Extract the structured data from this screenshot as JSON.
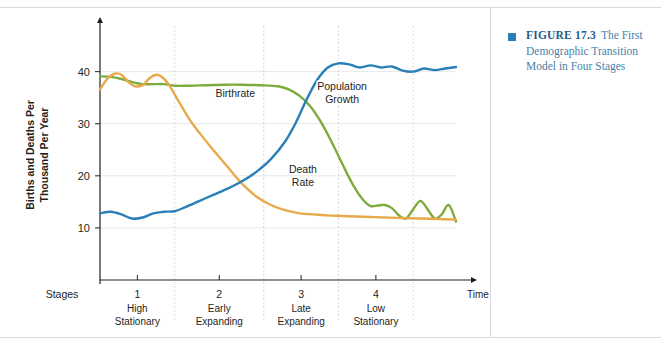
{
  "caption": {
    "figure_number": "FIGURE 17.3",
    "text": "The First Demographic Transition Model in Four Stages",
    "bullet_color": "#2b7fb8",
    "text_color": "#4a7fa8"
  },
  "chart_data": {
    "type": "line",
    "title": "",
    "xlabel": "Time",
    "ylabel": "Births and Deaths Per Thousand Per Year",
    "ylim": [
      0,
      48
    ],
    "xlim": [
      0,
      100
    ],
    "yticks": [
      10,
      20,
      30,
      40
    ],
    "ytick_labels": [
      "10",
      "20",
      "30",
      "40"
    ],
    "grid": true,
    "legend": "inline-annotations",
    "stages_axis_label": "Stages",
    "time_axis_label": "Time",
    "stage_boundaries": [
      21,
      46,
      67,
      88
    ],
    "stages": [
      {
        "number": "1",
        "name_line1": "High",
        "name_line2": "Stationary",
        "x": 10.5
      },
      {
        "number": "2",
        "name_line1": "Early",
        "name_line2": "Expanding",
        "x": 33.5
      },
      {
        "number": "3",
        "name_line1": "Late",
        "name_line2": "Expanding",
        "x": 56.5
      },
      {
        "number": "4",
        "name_line1": "Low",
        "name_line2": "Stationary",
        "x": 77.5
      }
    ],
    "series": [
      {
        "name": "Birthrate",
        "color": "#7dab3c",
        "label_x": 38,
        "label_y": 35.2,
        "label_lines": [
          "Birthrate"
        ],
        "x": [
          0,
          3,
          6,
          9,
          12,
          15,
          18,
          21,
          25,
          30,
          35,
          40,
          45,
          50,
          53,
          56,
          59,
          62,
          65,
          68,
          70,
          72,
          74,
          76,
          78,
          80,
          82,
          84,
          86,
          88,
          90,
          92,
          94,
          96,
          98,
          100
        ],
        "values": [
          39.1,
          39.0,
          38.6,
          38.0,
          37.6,
          37.6,
          37.6,
          37.3,
          37.3,
          37.4,
          37.5,
          37.5,
          37.4,
          37.2,
          36.6,
          35.4,
          33.4,
          30.4,
          26.6,
          22.4,
          19.6,
          17.2,
          15.3,
          14.2,
          14.3,
          14.4,
          13.8,
          12.4,
          11.8,
          13.6,
          15.2,
          13.6,
          11.8,
          12.6,
          14.4,
          11.2
        ]
      },
      {
        "name": "Death Rate",
        "color": "#e8a94a",
        "label_x": 57,
        "label_y": 20.6,
        "label_lines": [
          "Death",
          "Rate"
        ],
        "x": [
          0,
          2,
          4,
          6,
          8,
          10,
          12,
          14,
          16,
          18,
          20,
          22,
          25,
          28,
          32,
          36,
          40,
          44,
          48,
          52,
          56,
          60,
          64,
          68,
          72,
          76,
          80,
          85,
          90,
          95,
          100
        ],
        "values": [
          36.6,
          38.6,
          39.6,
          39.4,
          38.0,
          37.2,
          37.4,
          38.8,
          39.4,
          38.6,
          36.8,
          34.4,
          31.0,
          28.2,
          24.8,
          21.6,
          18.4,
          16.0,
          14.4,
          13.4,
          12.8,
          12.6,
          12.4,
          12.3,
          12.2,
          12.1,
          12.0,
          11.9,
          11.8,
          11.7,
          11.6
        ]
      },
      {
        "name": "Population Growth",
        "color": "#2b7fb8",
        "label_x": 68,
        "label_y": 36.4,
        "label_lines": [
          "Population",
          "Growth"
        ],
        "x": [
          0,
          3,
          6,
          9,
          12,
          15,
          18,
          21,
          24,
          28,
          32,
          36,
          40,
          44,
          48,
          52,
          55,
          58,
          61,
          64,
          67,
          70,
          73,
          76,
          79,
          82,
          85,
          88,
          91,
          94,
          97,
          100
        ],
        "values": [
          12.8,
          13.1,
          12.6,
          11.8,
          12.0,
          12.8,
          13.1,
          13.2,
          14.0,
          15.2,
          16.4,
          17.6,
          19.0,
          20.8,
          23.2,
          26.6,
          30.2,
          34.6,
          38.4,
          40.8,
          41.6,
          41.4,
          40.8,
          41.2,
          40.8,
          41.0,
          40.2,
          40.0,
          40.6,
          40.3,
          40.6,
          40.9
        ]
      }
    ]
  }
}
